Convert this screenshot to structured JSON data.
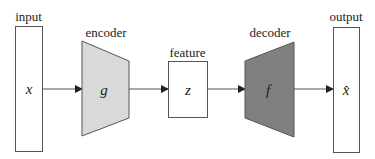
{
  "diagram": {
    "type": "autoencoder-architecture",
    "nodes": [
      {
        "id": "input",
        "label": "input",
        "symbol": "x",
        "shape": "rectangle",
        "fill": "#ffffff"
      },
      {
        "id": "encoder",
        "label": "encoder",
        "symbol": "g",
        "shape": "trapezoid-narrowing",
        "fill": "#d9d9d9"
      },
      {
        "id": "feature",
        "label": "feature",
        "symbol": "z",
        "shape": "rectangle",
        "fill": "#ffffff"
      },
      {
        "id": "decoder",
        "label": "decoder",
        "symbol": "f",
        "shape": "trapezoid-widening",
        "fill": "#808080"
      },
      {
        "id": "output",
        "label": "output",
        "symbol": "x̂",
        "shape": "rectangle",
        "fill": "#ffffff"
      }
    ],
    "edges": [
      {
        "from": "input",
        "to": "encoder"
      },
      {
        "from": "encoder",
        "to": "feature"
      },
      {
        "from": "feature",
        "to": "decoder"
      },
      {
        "from": "decoder",
        "to": "output"
      }
    ],
    "colors": {
      "stroke": "#555555",
      "encoder_fill": "#d9d9d9",
      "decoder_fill": "#808080",
      "text": "#222222"
    }
  }
}
